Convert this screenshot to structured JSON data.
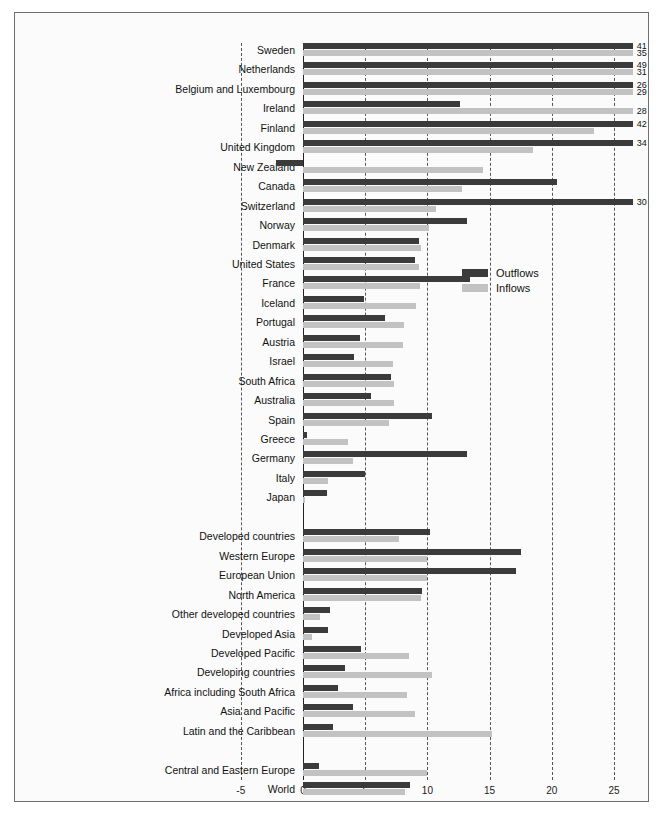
{
  "chart_data": {
    "type": "bar",
    "orientation": "horizontal",
    "title": "",
    "subtitle": "",
    "xlabel": "",
    "ylabel": "",
    "xlim": [
      -5,
      26.5
    ],
    "xticks": [
      -5,
      0,
      5,
      10,
      15,
      20,
      25
    ],
    "xtick_labels": [
      "-5",
      "0",
      "5",
      "10",
      "15",
      "20",
      "25"
    ],
    "grid": true,
    "grid_style": "dashed vertical",
    "legend": {
      "position": "center-right",
      "entries": [
        {
          "name": "Outflows",
          "color": "#3b3b3b"
        },
        {
          "name": "Inflows",
          "color": "#c2c2c2"
        }
      ]
    },
    "series": [
      {
        "name": "Outflows",
        "color": "#3b3b3b"
      },
      {
        "name": "Inflows",
        "color": "#c2c2c2"
      }
    ],
    "categories": [
      "Sweden",
      "Netherlands",
      "Belgium and Luxembourg",
      "Ireland",
      "Finland",
      "United Kingdom",
      "New Zealand",
      "Canada",
      "Switzerland",
      "Norway",
      "Denmark",
      "United States",
      "France",
      "Iceland",
      "Portugal",
      "Austria",
      "Israel",
      "South Africa",
      "Australia",
      "Spain",
      "Greece",
      "Germany",
      "Italy",
      "Japan",
      "",
      "Developed countries",
      "Western  Europe",
      "European Union",
      "North America",
      "Other developed countries",
      "Developed Asia",
      "Developed Pacific",
      "Developing countries",
      "Africa including South Africa",
      "Asia and Pacific",
      "Latin and the Caribbean",
      "",
      "Central and Eastern Europe",
      "World"
    ],
    "rows": [
      {
        "label": "Sweden",
        "outflow": 26.5,
        "inflow": 26.5,
        "outflow_text": "41",
        "inflow_text": "35"
      },
      {
        "label": "Netherlands",
        "outflow": 26.5,
        "inflow": 26.5,
        "outflow_text": "49",
        "inflow_text": "31"
      },
      {
        "label": "Belgium and Luxembourg",
        "outflow": 26.5,
        "inflow": 26.5,
        "outflow_text": "26",
        "inflow_text": "29"
      },
      {
        "label": "Ireland",
        "outflow": 12.6,
        "inflow": 26.5,
        "outflow_text": "",
        "inflow_text": "28"
      },
      {
        "label": "Finland",
        "outflow": 26.5,
        "inflow": 23.4,
        "outflow_text": "42",
        "inflow_text": ""
      },
      {
        "label": "United Kingdom",
        "outflow": 26.5,
        "inflow": 18.5,
        "outflow_text": "34",
        "inflow_text": ""
      },
      {
        "label": "New Zealand",
        "outflow": -2.2,
        "inflow": 14.5,
        "outflow_text": "",
        "inflow_text": ""
      },
      {
        "label": "Canada",
        "outflow": 20.4,
        "inflow": 12.8,
        "outflow_text": "",
        "inflow_text": ""
      },
      {
        "label": "Switzerland",
        "outflow": 26.5,
        "inflow": 10.7,
        "outflow_text": "30",
        "inflow_text": ""
      },
      {
        "label": "Norway",
        "outflow": 13.2,
        "inflow": 10.1,
        "outflow_text": "",
        "inflow_text": ""
      },
      {
        "label": "Denmark",
        "outflow": 9.3,
        "inflow": 9.5,
        "outflow_text": "",
        "inflow_text": ""
      },
      {
        "label": "United States",
        "outflow": 9.0,
        "inflow": 9.3,
        "outflow_text": "",
        "inflow_text": ""
      },
      {
        "label": "France",
        "outflow": 13.4,
        "inflow": 9.4,
        "outflow_text": "",
        "inflow_text": ""
      },
      {
        "label": "Iceland",
        "outflow": 4.9,
        "inflow": 9.1,
        "outflow_text": "",
        "inflow_text": ""
      },
      {
        "label": "Portugal",
        "outflow": 6.6,
        "inflow": 8.1,
        "outflow_text": "",
        "inflow_text": ""
      },
      {
        "label": "Austria",
        "outflow": 4.6,
        "inflow": 8.0,
        "outflow_text": "",
        "inflow_text": ""
      },
      {
        "label": "Israel",
        "outflow": 4.1,
        "inflow": 7.2,
        "outflow_text": "",
        "inflow_text": ""
      },
      {
        "label": "South Africa",
        "outflow": 7.1,
        "inflow": 7.3,
        "outflow_text": "",
        "inflow_text": ""
      },
      {
        "label": "Australia",
        "outflow": 5.5,
        "inflow": 7.3,
        "outflow_text": "",
        "inflow_text": ""
      },
      {
        "label": "Spain",
        "outflow": 10.4,
        "inflow": 6.9,
        "outflow_text": "",
        "inflow_text": ""
      },
      {
        "label": "Greece",
        "outflow": 0.3,
        "inflow": 3.6,
        "outflow_text": "",
        "inflow_text": ""
      },
      {
        "label": "Germany",
        "outflow": 13.2,
        "inflow": 4.0,
        "outflow_text": "",
        "inflow_text": ""
      },
      {
        "label": "Italy",
        "outflow": 5.0,
        "inflow": 2.0,
        "outflow_text": "",
        "inflow_text": ""
      },
      {
        "label": "Japan",
        "outflow": 1.9,
        "inflow": 0.2,
        "outflow_text": "",
        "inflow_text": ""
      },
      {
        "label": "Developed countries",
        "outflow": 10.2,
        "inflow": 7.7,
        "outflow_text": "",
        "inflow_text": ""
      },
      {
        "label": "Western  Europe",
        "outflow": 17.5,
        "inflow": 10.0,
        "outflow_text": "",
        "inflow_text": ""
      },
      {
        "label": "European Union",
        "outflow": 17.1,
        "inflow": 10.0,
        "outflow_text": "",
        "inflow_text": ""
      },
      {
        "label": "North America",
        "outflow": 9.6,
        "inflow": 9.5,
        "outflow_text": "",
        "inflow_text": ""
      },
      {
        "label": "Other developed countries",
        "outflow": 2.2,
        "inflow": 1.4,
        "outflow_text": "",
        "inflow_text": ""
      },
      {
        "label": "Developed Asia",
        "outflow": 2.0,
        "inflow": 0.7,
        "outflow_text": "",
        "inflow_text": ""
      },
      {
        "label": "Developed Pacific",
        "outflow": 4.7,
        "inflow": 8.5,
        "outflow_text": "",
        "inflow_text": ""
      },
      {
        "label": "Developing countries",
        "outflow": 3.4,
        "inflow": 10.4,
        "outflow_text": "",
        "inflow_text": ""
      },
      {
        "label": "Africa including South Africa",
        "outflow": 2.8,
        "inflow": 8.4,
        "outflow_text": "",
        "inflow_text": ""
      },
      {
        "label": "Asia and Pacific",
        "outflow": 4.0,
        "inflow": 9.0,
        "outflow_text": "",
        "inflow_text": ""
      },
      {
        "label": "Latin and the Caribbean",
        "outflow": 2.4,
        "inflow": 15.2,
        "outflow_text": "",
        "inflow_text": ""
      },
      {
        "label": "Central and Eastern Europe",
        "outflow": 1.3,
        "inflow": 10.0,
        "outflow_text": "",
        "inflow_text": ""
      },
      {
        "label": "World",
        "outflow": 8.6,
        "inflow": 8.2,
        "outflow_text": "",
        "inflow_text": ""
      }
    ]
  }
}
